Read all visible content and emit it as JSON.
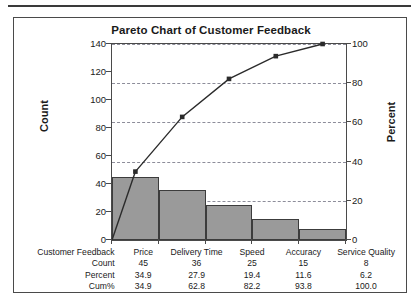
{
  "chart_data": {
    "type": "bar",
    "title": "Pareto Chart of Customer Feedback",
    "xlabel": "Customer Feedback",
    "ylabel": "Count",
    "y2label": "Percent",
    "categories": [
      "Price",
      "Delivery Time",
      "Speed",
      "Accuracy",
      "Service Quality"
    ],
    "values": [
      45,
      36,
      25,
      15,
      8
    ],
    "series": [
      {
        "name": "Count",
        "values": [
          45,
          36,
          25,
          15,
          8
        ]
      },
      {
        "name": "Cum%",
        "values": [
          34.9,
          62.8,
          82.2,
          93.8,
          100.0
        ]
      }
    ],
    "percent": [
      34.9,
      27.9,
      19.4,
      11.6,
      6.2
    ],
    "cum_percent": [
      34.9,
      62.8,
      82.2,
      93.8,
      100.0
    ],
    "ylim": [
      0,
      140
    ],
    "y2lim": [
      0,
      100
    ],
    "yticks": [
      0,
      20,
      40,
      60,
      80,
      100,
      120,
      140
    ],
    "y2ticks": [
      0,
      20,
      40,
      60,
      80,
      100
    ],
    "grid": true,
    "legend": "none",
    "total_count": 129,
    "bar_color": "#9a9a9a",
    "bar_edge_color": "#3c3c3c",
    "line_color": "#2b2b2b",
    "grid_color": "#8d8d9a",
    "axis_color": "#4a4a4a"
  },
  "table": {
    "rows": [
      {
        "label": "Customer Feedback",
        "values": [
          "Price",
          "Delivery Time",
          "Speed",
          "Accuracy",
          "Service Quality"
        ]
      },
      {
        "label": "Count",
        "values": [
          "45",
          "36",
          "25",
          "15",
          "8"
        ]
      },
      {
        "label": "Percent",
        "values": [
          "34.9",
          "27.9",
          "19.4",
          "11.6",
          "6.2"
        ]
      },
      {
        "label": "Cum%",
        "values": [
          "34.9",
          "62.8",
          "82.2",
          "93.8",
          "100.0"
        ]
      }
    ]
  }
}
